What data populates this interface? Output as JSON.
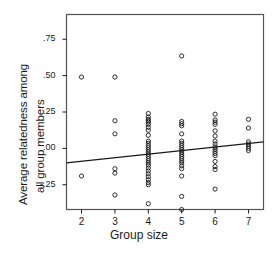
{
  "chart_data": {
    "type": "scatter",
    "title": "",
    "xlabel": "Group size",
    "ylabel": "Average relatedness among all group members",
    "ylabel_lines": [
      "Average relatedness among",
      "all group members"
    ],
    "xlim": [
      1.55,
      7.45
    ],
    "ylim": [
      -0.42,
      0.92
    ],
    "grid": false,
    "legend": null,
    "xticks": [
      2,
      3,
      4,
      5,
      6,
      7
    ],
    "xtick_labels": [
      "2",
      "3",
      "4",
      "5",
      "6",
      "7"
    ],
    "yticks": [
      0.75,
      0.5,
      0.25,
      0.0,
      -0.25
    ],
    "ytick_labels": [
      ".75",
      ".50",
      ".25",
      ".00",
      "-.25"
    ],
    "marker": "open-circle",
    "marker_color": "#1a1a1a",
    "points": [
      {
        "x": 2,
        "y": 0.49
      },
      {
        "x": 2,
        "y": -0.19
      },
      {
        "x": 3,
        "y": 0.49
      },
      {
        "x": 3,
        "y": 0.19
      },
      {
        "x": 3,
        "y": 0.1
      },
      {
        "x": 3,
        "y": -0.14
      },
      {
        "x": 3,
        "y": -0.17
      },
      {
        "x": 3,
        "y": -0.32
      },
      {
        "x": 4,
        "y": 0.24
      },
      {
        "x": 4,
        "y": 0.215
      },
      {
        "x": 4,
        "y": 0.2
      },
      {
        "x": 4,
        "y": 0.19
      },
      {
        "x": 4,
        "y": 0.18
      },
      {
        "x": 4,
        "y": 0.165
      },
      {
        "x": 4,
        "y": 0.145
      },
      {
        "x": 4,
        "y": 0.125
      },
      {
        "x": 4,
        "y": 0.09
      },
      {
        "x": 4,
        "y": 0.05
      },
      {
        "x": 4,
        "y": 0.035
      },
      {
        "x": 4,
        "y": 0.02
      },
      {
        "x": 4,
        "y": 0.005
      },
      {
        "x": 4,
        "y": -0.01
      },
      {
        "x": 4,
        "y": -0.025
      },
      {
        "x": 4,
        "y": -0.04
      },
      {
        "x": 4,
        "y": -0.055
      },
      {
        "x": 4,
        "y": -0.07
      },
      {
        "x": 4,
        "y": -0.085
      },
      {
        "x": 4,
        "y": -0.1
      },
      {
        "x": 4,
        "y": -0.115
      },
      {
        "x": 4,
        "y": -0.135
      },
      {
        "x": 4,
        "y": -0.155
      },
      {
        "x": 4,
        "y": -0.175
      },
      {
        "x": 4,
        "y": -0.195
      },
      {
        "x": 4,
        "y": -0.215
      },
      {
        "x": 4,
        "y": -0.235
      },
      {
        "x": 4,
        "y": -0.25
      },
      {
        "x": 4,
        "y": -0.38
      },
      {
        "x": 5,
        "y": 0.635
      },
      {
        "x": 5,
        "y": 0.185
      },
      {
        "x": 5,
        "y": 0.17
      },
      {
        "x": 5,
        "y": 0.155
      },
      {
        "x": 5,
        "y": 0.1
      },
      {
        "x": 5,
        "y": 0.05
      },
      {
        "x": 5,
        "y": 0.035
      },
      {
        "x": 5,
        "y": 0.02
      },
      {
        "x": 5,
        "y": 0.005
      },
      {
        "x": 5,
        "y": -0.01
      },
      {
        "x": 5,
        "y": -0.025
      },
      {
        "x": 5,
        "y": -0.04
      },
      {
        "x": 5,
        "y": -0.055
      },
      {
        "x": 5,
        "y": -0.07
      },
      {
        "x": 5,
        "y": -0.085
      },
      {
        "x": 5,
        "y": -0.1
      },
      {
        "x": 5,
        "y": -0.12
      },
      {
        "x": 5,
        "y": -0.14
      },
      {
        "x": 5,
        "y": -0.19
      },
      {
        "x": 5,
        "y": -0.33
      },
      {
        "x": 5,
        "y": -0.42
      },
      {
        "x": 6,
        "y": 0.235
      },
      {
        "x": 6,
        "y": 0.195
      },
      {
        "x": 6,
        "y": 0.18
      },
      {
        "x": 6,
        "y": 0.165
      },
      {
        "x": 6,
        "y": 0.12
      },
      {
        "x": 6,
        "y": 0.085
      },
      {
        "x": 6,
        "y": 0.05
      },
      {
        "x": 6,
        "y": 0.03
      },
      {
        "x": 6,
        "y": 0.01
      },
      {
        "x": 6,
        "y": -0.005
      },
      {
        "x": 6,
        "y": -0.02
      },
      {
        "x": 6,
        "y": -0.035
      },
      {
        "x": 6,
        "y": -0.05
      },
      {
        "x": 6,
        "y": -0.09
      },
      {
        "x": 6,
        "y": -0.125
      },
      {
        "x": 6,
        "y": -0.145
      },
      {
        "x": 6,
        "y": -0.28
      },
      {
        "x": 7,
        "y": 0.2
      },
      {
        "x": 7,
        "y": 0.14
      },
      {
        "x": 7,
        "y": 0.045
      },
      {
        "x": 7,
        "y": 0.03
      },
      {
        "x": 7,
        "y": 0.015
      },
      {
        "x": 7,
        "y": 0.0
      },
      {
        "x": 7,
        "y": -0.015
      }
    ],
    "fit_line": {
      "type": "linear-regression",
      "x_start": 1.55,
      "y_start": -0.1,
      "x_end": 7.45,
      "y_end": 0.045,
      "color": "#1a1a1a"
    }
  },
  "axes": {
    "frame_color": "#555555",
    "tick_color": "#1a1a1a"
  }
}
